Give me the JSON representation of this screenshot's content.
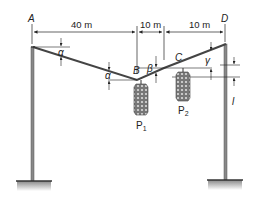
{
  "diagram": {
    "points": {
      "A": "A",
      "B": "B",
      "C": "C",
      "D": "D"
    },
    "dimensions": {
      "AB": "40 m",
      "BC": "10 m",
      "CD": "10 m"
    },
    "angles": {
      "alpha1": "α",
      "alpha2": "α",
      "beta": "β",
      "gamma": "γ"
    },
    "offset_label": "l",
    "loads": {
      "P1": {
        "letter": "P",
        "sub": "1"
      },
      "P2": {
        "letter": "P",
        "sub": "2"
      }
    },
    "colors": {
      "line": "#444444",
      "pole": "#777777",
      "load": "#555555"
    }
  }
}
